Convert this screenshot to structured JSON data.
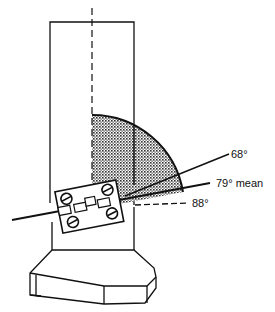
{
  "diagram": {
    "labels": {
      "angle_68": "68°",
      "angle_79": "79° mean",
      "angle_88": "88°"
    },
    "colors": {
      "line": "#111111",
      "shade": "#555555",
      "background": "#ffffff"
    }
  }
}
